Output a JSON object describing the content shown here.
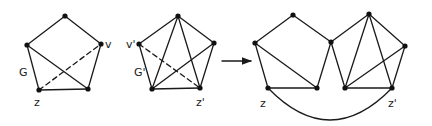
{
  "colors": {
    "ink": "#1a1a1a",
    "background": "#ffffff"
  },
  "graphs": [
    {
      "id": "G",
      "vertices": {
        "top": [
          65,
          16
        ],
        "v": [
          101,
          44
        ],
        "left": [
          27,
          45
        ],
        "z": [
          39,
          90
        ],
        "br": [
          88,
          89
        ]
      },
      "edges": [
        [
          "top",
          "left",
          "solid"
        ],
        [
          "top",
          "v",
          "solid"
        ],
        [
          "left",
          "z",
          "solid"
        ],
        [
          "z",
          "br",
          "solid"
        ],
        [
          "v",
          "br",
          "solid"
        ],
        [
          "left",
          "br",
          "solid"
        ],
        [
          "z",
          "v",
          "dashed"
        ]
      ],
      "labels": [
        {
          "text": "v",
          "x": 105,
          "y": 48,
          "name": "label-v"
        },
        {
          "text": "G",
          "x": 19,
          "y": 76,
          "name": "label-G"
        },
        {
          "text": "z",
          "x": 34,
          "y": 106,
          "name": "label-z"
        }
      ]
    },
    {
      "id": "G'",
      "vertices": {
        "top": [
          178,
          16
        ],
        "vp": [
          139,
          44
        ],
        "right": [
          214,
          43
        ],
        "bl": [
          152,
          89
        ],
        "zp": [
          200,
          88
        ]
      },
      "edges": [
        [
          "top",
          "vp",
          "solid"
        ],
        [
          "top",
          "right",
          "solid"
        ],
        [
          "vp",
          "bl",
          "solid"
        ],
        [
          "bl",
          "zp",
          "solid"
        ],
        [
          "right",
          "zp",
          "solid"
        ],
        [
          "top",
          "bl",
          "solid"
        ],
        [
          "top",
          "zp",
          "solid"
        ],
        [
          "bl",
          "right",
          "solid"
        ],
        [
          "vp",
          "zp",
          "dashed"
        ]
      ],
      "labels": [
        {
          "text": "v'",
          "x": 126,
          "y": 48,
          "name": "label-v-prime"
        },
        {
          "text": "G'",
          "x": 134,
          "y": 76,
          "name": "label-G-prime"
        },
        {
          "text": "z'",
          "x": 196,
          "y": 106,
          "name": "label-z-prime"
        }
      ]
    },
    {
      "id": "merged",
      "vertices": {
        "l": [
          255,
          43
        ],
        "t1": [
          293,
          15
        ],
        "m": [
          331,
          42
        ],
        "z": [
          268,
          88
        ],
        "b1": [
          317,
          88
        ],
        "t2": [
          369,
          14
        ],
        "r": [
          405,
          46
        ],
        "b2": [
          345,
          88
        ],
        "zp": [
          392,
          88
        ]
      },
      "edges": [
        [
          "l",
          "t1",
          "solid"
        ],
        [
          "t1",
          "m",
          "solid"
        ],
        [
          "l",
          "z",
          "solid"
        ],
        [
          "z",
          "b1",
          "solid"
        ],
        [
          "b1",
          "m",
          "solid"
        ],
        [
          "l",
          "b1",
          "solid"
        ],
        [
          "m",
          "t2",
          "solid"
        ],
        [
          "t2",
          "r",
          "solid"
        ],
        [
          "m",
          "b2",
          "solid"
        ],
        [
          "b2",
          "zp",
          "solid"
        ],
        [
          "r",
          "zp",
          "solid"
        ],
        [
          "t2",
          "b2",
          "solid"
        ],
        [
          "t2",
          "zp",
          "solid"
        ],
        [
          "b2",
          "r",
          "solid"
        ]
      ],
      "arc": {
        "from": "z",
        "to": "zp",
        "control": [
          330,
          152
        ]
      },
      "labels": [
        {
          "text": "z",
          "x": 260,
          "y": 107,
          "name": "label-merged-z"
        },
        {
          "text": "z'",
          "x": 388,
          "y": 107,
          "name": "label-merged-z-prime"
        }
      ]
    }
  ],
  "arrow": {
    "from": [
      222,
      61
    ],
    "to": [
      251,
      61
    ]
  }
}
